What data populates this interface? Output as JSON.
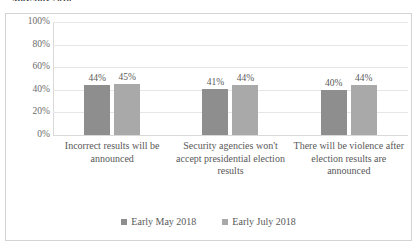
{
  "chart_data": {
    "type": "bar",
    "title": "May/July 2018",
    "xlabel": "",
    "ylabel": "",
    "ylim": [
      0,
      100
    ],
    "yticks": [
      "100%",
      "80%",
      "60%",
      "40%",
      "20%",
      "0%"
    ],
    "ytick_values": [
      100,
      80,
      60,
      40,
      20,
      0
    ],
    "grid": true,
    "legend_position": "bottom",
    "categories": [
      "Incorrect results will be announced",
      "Security agencies won't accept presidential election results",
      "There will be violence after election results are announced"
    ],
    "series": [
      {
        "name": "Early May 2018",
        "color": "#8e8e8e",
        "values": [
          44,
          41,
          40
        ],
        "labels": [
          "44%",
          "41%",
          "40%"
        ]
      },
      {
        "name": "Early July 2018",
        "color": "#a9a9a9",
        "values": [
          45,
          44,
          44
        ],
        "labels": [
          "45%",
          "44%",
          "44%"
        ]
      }
    ]
  },
  "legend": {
    "items": [
      {
        "label": "Early May 2018"
      },
      {
        "label": "Early July 2018"
      }
    ]
  }
}
